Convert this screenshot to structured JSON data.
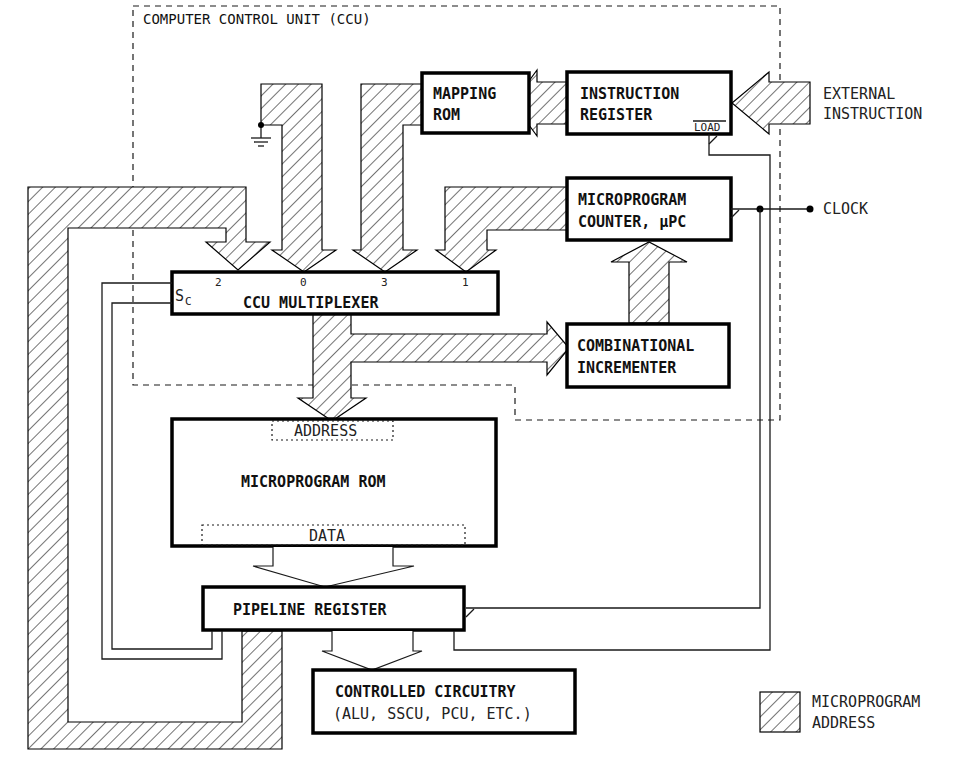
{
  "diagram": {
    "title": "COMPUTER CONTROL UNIT (CCU)",
    "colors": {
      "stroke": "#000000",
      "background": "#ffffff",
      "hatch": "#000000"
    },
    "blocks": {
      "mapping_rom": {
        "line1": "MAPPING",
        "line2": "ROM"
      },
      "instruction_register": {
        "line1": "INSTRUCTION",
        "line2": "REGISTER",
        "load_label": "LOAD"
      },
      "micro_pc": {
        "line1": "MICROPROGRAM",
        "line2": "COUNTER, µPC"
      },
      "ccu_mux": {
        "label": "CCU MULTIPLEXER",
        "select_label": "S",
        "select_sub": "C",
        "inputs": [
          "2",
          "0",
          "3",
          "1"
        ]
      },
      "incrementer": {
        "line1": "COMBINATIONAL",
        "line2": "INCREMENTER"
      },
      "microprogram_rom": {
        "label": "MICROPROGRAM ROM",
        "address_label": "ADDRESS",
        "data_label": "DATA"
      },
      "pipeline_register": {
        "label": "PIPELINE REGISTER"
      },
      "controlled_circuitry": {
        "line1": "CONTROLLED CIRCUITRY",
        "line2": "(ALU, SSCU, PCU, ETC.)"
      }
    },
    "external": {
      "instruction_line1": "EXTERNAL",
      "instruction_line2": "INSTRUCTION",
      "clock": "CLOCK"
    },
    "legend": {
      "line1": "MICROPROGRAM",
      "line2": "ADDRESS"
    }
  }
}
